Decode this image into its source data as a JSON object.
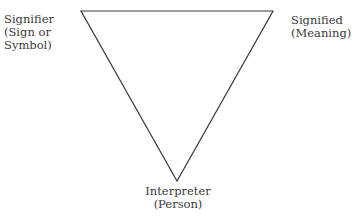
{
  "diagram": {
    "nodes": [
      {
        "id": "signifier",
        "lines": [
          "Signifier",
          "(Sign or",
          "Symbol)"
        ]
      },
      {
        "id": "signified",
        "lines": [
          "Signified",
          "(Meaning)"
        ]
      },
      {
        "id": "interpreter",
        "lines": [
          "Interpreter",
          "(Person)"
        ]
      }
    ],
    "edges": [
      {
        "from": "signifier",
        "to": "signified"
      },
      {
        "from": "signified",
        "to": "interpreter"
      },
      {
        "from": "interpreter",
        "to": "signifier"
      }
    ],
    "colors": {
      "line": "#3a3a3a",
      "text": "#3a3a3a",
      "background": "#ffffff"
    }
  }
}
